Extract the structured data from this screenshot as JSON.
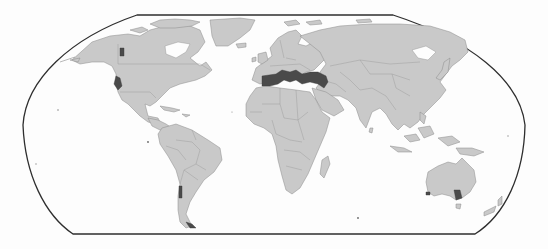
{
  "map": {
    "projection": "Robinson-like pseudocylindrical world map",
    "colors": {
      "background": "#fdfdfd",
      "land": "#c9c9c9",
      "country_border": "#8a8a8a",
      "highlight": "#4a4a4a",
      "frame": "#2e2e2e"
    },
    "legend": null,
    "title": null,
    "highlighted_regions": [
      {
        "id": "mediterranean-basin",
        "name": "Mediterranean Basin"
      },
      {
        "id": "california",
        "name": "California coast"
      },
      {
        "id": "pacific-northwest",
        "name": "Pacific Northwest / British Columbia coast"
      },
      {
        "id": "central-chile",
        "name": "Central Chile"
      },
      {
        "id": "southern-chile",
        "name": "Southern Chile / Patagonia"
      },
      {
        "id": "southwest-australia",
        "name": "Southwest Australia"
      },
      {
        "id": "southeast-australia",
        "name": "South Australia / Victoria"
      }
    ]
  }
}
